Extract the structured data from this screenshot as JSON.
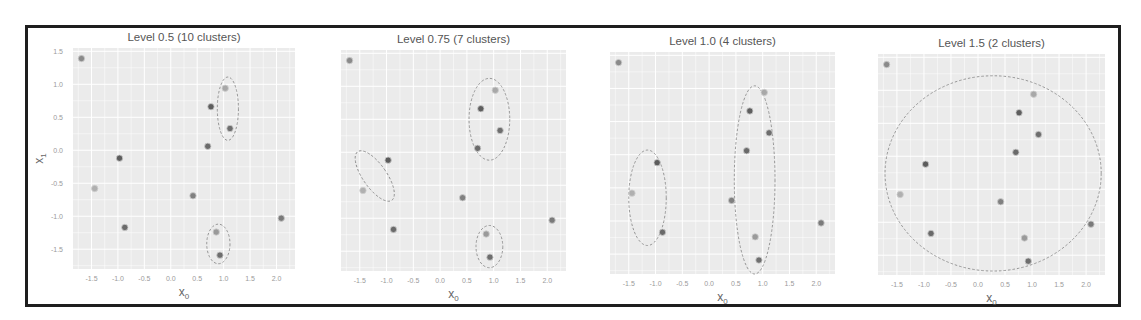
{
  "chart_data": [
    {
      "type": "scatter",
      "title": "Level 0.5 (10 clusters)",
      "xlabel": "x0",
      "ylabel": "x1",
      "xlim": [
        -1.85,
        2.35
      ],
      "ylim": [
        -1.8,
        1.55
      ],
      "xticks": [
        -1.5,
        -1.0,
        -0.5,
        0.0,
        0.5,
        1.0,
        1.5,
        2.0
      ],
      "yticks": [
        1.5,
        1.0,
        0.5,
        0.0,
        -0.5,
        -1.0,
        -1.5
      ],
      "grid": true,
      "ellipses": [
        {
          "cx": 1.08,
          "cy": 0.63,
          "rx": 0.2,
          "ry": 0.48
        },
        {
          "cx": 0.9,
          "cy": -1.42,
          "rx": 0.22,
          "ry": 0.3
        }
      ]
    },
    {
      "type": "scatter",
      "title": "Level 0.75 (7 clusters)",
      "xlabel": "x0",
      "ylabel": "",
      "xlim": [
        -1.85,
        2.35
      ],
      "ylim": [
        -1.8,
        1.55
      ],
      "xticks": [
        -1.5,
        -1.0,
        -0.5,
        0.0,
        0.5,
        1.0,
        1.5,
        2.0
      ],
      "grid": true,
      "ellipses": [
        {
          "cx": 0.92,
          "cy": 0.5,
          "rx": 0.38,
          "ry": 0.62
        },
        {
          "cx": -1.22,
          "cy": -0.36,
          "rx": 0.22,
          "ry": 0.45,
          "angle": 35
        },
        {
          "cx": 0.92,
          "cy": -1.43,
          "rx": 0.25,
          "ry": 0.32
        }
      ]
    },
    {
      "type": "scatter",
      "title": "Level 1.0 (4 clusters)",
      "xlabel": "x0",
      "ylabel": "",
      "xlim": [
        -1.85,
        2.35
      ],
      "ylim": [
        -1.8,
        1.55
      ],
      "xticks": [
        -1.5,
        -1.0,
        -0.5,
        0.0,
        0.5,
        1.0,
        1.5,
        2.0
      ],
      "grid": true,
      "ellipses": [
        {
          "cx": -1.15,
          "cy": -0.65,
          "rx": 0.35,
          "ry": 0.72
        },
        {
          "cx": 0.85,
          "cy": -0.38,
          "rx": 0.38,
          "ry": 1.42
        }
      ]
    },
    {
      "type": "scatter",
      "title": "Level 1.5 (2 clusters)",
      "xlabel": "x0",
      "ylabel": "",
      "xlim": [
        -1.85,
        2.35
      ],
      "ylim": [
        -1.8,
        1.55
      ],
      "xticks": [
        -1.5,
        -1.0,
        -0.5,
        0.0,
        0.5,
        1.0,
        1.5,
        2.0
      ],
      "grid": true,
      "ellipses": [
        {
          "cx": 0.28,
          "cy": -0.26,
          "rx": 2.0,
          "ry": 1.48
        }
      ]
    }
  ],
  "points": [
    {
      "x": -1.69,
      "y": 1.39,
      "shade": "#8a8a8a"
    },
    {
      "x": 1.03,
      "y": 0.94,
      "shade": "#a8a8a8"
    },
    {
      "x": 0.76,
      "y": 0.66,
      "shade": "#5e5e5e"
    },
    {
      "x": 1.12,
      "y": 0.33,
      "shade": "#6e6e6e"
    },
    {
      "x": 0.7,
      "y": 0.06,
      "shade": "#6a6a6a"
    },
    {
      "x": -0.97,
      "y": -0.12,
      "shade": "#5c5c5c"
    },
    {
      "x": -1.44,
      "y": -0.58,
      "shade": "#b0b0b0"
    },
    {
      "x": 0.42,
      "y": -0.69,
      "shade": "#808080"
    },
    {
      "x": 2.09,
      "y": -1.03,
      "shade": "#7a7a7a"
    },
    {
      "x": -0.87,
      "y": -1.17,
      "shade": "#6a6a6a"
    },
    {
      "x": 0.86,
      "y": -1.24,
      "shade": "#9a9a9a"
    },
    {
      "x": 0.93,
      "y": -1.59,
      "shade": "#6e6e6e"
    }
  ],
  "panels": [
    {
      "title": "Level 0.5 (10 clusters)",
      "left": 73,
      "top": 48,
      "width": 222,
      "height": 221,
      "show_ylabel": true
    },
    {
      "title": "Level 0.75 (7 clusters)",
      "left": 341,
      "top": 50,
      "width": 225,
      "height": 221,
      "show_ylabel": false
    },
    {
      "title": "Level 1.0 (4 clusters)",
      "left": 610,
      "top": 52,
      "width": 225,
      "height": 222,
      "show_ylabel": false
    },
    {
      "title": "Level 1.5 (2 clusters)",
      "left": 878,
      "top": 54,
      "width": 227,
      "height": 221,
      "show_ylabel": false
    }
  ],
  "labels": {
    "xlabel_main": "x",
    "xlabel_sub": "0",
    "ylabel_main": "x",
    "ylabel_sub": "1"
  },
  "colors": {
    "plot_bg": "#ebebeb",
    "grid": "#ffffff",
    "ellipse": "#8c8c8c",
    "frame": "#1e1e1e"
  }
}
